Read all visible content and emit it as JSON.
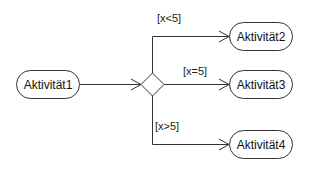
{
  "diagram": {
    "type": "UML activity diagram (decision node)",
    "nodes": [
      {
        "id": "a1",
        "label": "Aktivität1"
      },
      {
        "id": "a2",
        "label": "Aktivität2"
      },
      {
        "id": "a3",
        "label": "Aktivität3"
      },
      {
        "id": "a4",
        "label": "Aktivität4"
      }
    ],
    "decision": {
      "id": "d1",
      "shape": "diamond"
    },
    "edges": [
      {
        "from": "a1",
        "to": "d1",
        "guard": ""
      },
      {
        "from": "d1",
        "to": "a2",
        "guard": "[x<5]"
      },
      {
        "from": "d1",
        "to": "a3",
        "guard": "[x=5]"
      },
      {
        "from": "d1",
        "to": "a4",
        "guard": "[x>5]"
      }
    ],
    "colors": {
      "stroke": "#333333",
      "background": "#ffffff",
      "text": "#111111"
    }
  }
}
